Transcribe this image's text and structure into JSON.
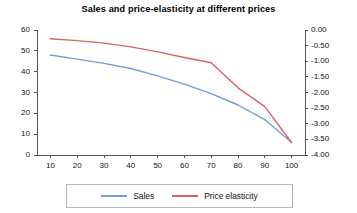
{
  "chart_data": {
    "type": "line",
    "title": "Sales and price-elasticity at different prices",
    "xlabel": "",
    "ylabel": "",
    "grid": false,
    "legend_position": "bottom",
    "x": [
      10,
      20,
      30,
      40,
      50,
      60,
      70,
      80,
      90,
      100
    ],
    "xlim": [
      5,
      105
    ],
    "xticks": [
      "10",
      "20",
      "30",
      "40",
      "50",
      "60",
      "70",
      "80",
      "90",
      "100"
    ],
    "axes": {
      "left": {
        "label": "Sales",
        "ylim": [
          0,
          60
        ],
        "ticks": [
          "0",
          "10",
          "20",
          "30",
          "40",
          "50",
          "60"
        ],
        "tick_values": [
          0,
          10,
          20,
          30,
          40,
          50,
          60
        ]
      },
      "right": {
        "label": "Price elasticity",
        "ylim": [
          -4.0,
          0.0
        ],
        "ticks": [
          "0.00",
          "-0.50",
          "-1.00",
          "-1.50",
          "-2.00",
          "-2.50",
          "-3.00",
          "-3.50",
          "-4.00"
        ],
        "tick_values": [
          0.0,
          -0.5,
          -1.0,
          -1.5,
          -2.0,
          -2.5,
          -3.0,
          -3.5,
          -4.0
        ]
      }
    },
    "series": [
      {
        "name": "Sales",
        "axis": "left",
        "color": "#6f9fd8",
        "values": [
          48,
          46,
          44,
          41.5,
          38,
          34,
          29.5,
          24,
          17,
          6
        ]
      },
      {
        "name": "Price elasticity",
        "axis": "right",
        "color": "#e06060",
        "values": [
          -0.28,
          -0.34,
          -0.42,
          -0.54,
          -0.7,
          -0.88,
          -1.05,
          -1.85,
          -2.45,
          -3.6
        ]
      }
    ]
  },
  "legend": {
    "items": [
      {
        "label": "Sales",
        "color": "#6f9fd8"
      },
      {
        "label": "Price elasticity",
        "color": "#e06060"
      }
    ]
  }
}
